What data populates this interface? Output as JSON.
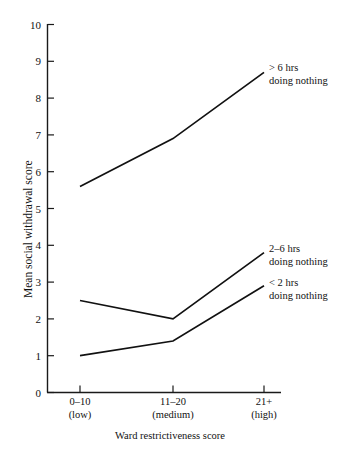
{
  "chart_data": {
    "type": "line",
    "title": "",
    "subtitle": "",
    "xlabel": "Ward restrictiveness score",
    "ylabel": "Mean social withdrawal score",
    "categories": [
      "0–10\n(low)",
      "11–20\n(medium)",
      "21+\n(high)"
    ],
    "category_labels": [
      {
        "line1": "0–10",
        "line2": "(low)"
      },
      {
        "line1": "11–20",
        "line2": "(medium)"
      },
      {
        "line1": "21+",
        "line2": "(high)"
      }
    ],
    "ylim": [
      0,
      10
    ],
    "ytick_labels": [
      "0",
      "1",
      "2",
      "3",
      "4",
      "5",
      "6",
      "7",
      "8",
      "9",
      "10"
    ],
    "ytick_values": [
      0,
      1,
      2,
      3,
      4,
      5,
      6,
      7,
      8,
      9,
      10
    ],
    "grid": false,
    "legend_position": "right-inline-annotations",
    "series": [
      {
        "name": "> 6 hrs doing nothing",
        "label_line1": "> 6 hrs",
        "label_line2": "doing nothing",
        "values": [
          5.6,
          6.9,
          8.7
        ],
        "color": "#111111"
      },
      {
        "name": "2–6 hrs doing nothing",
        "label_line1": "2–6 hrs",
        "label_line2": "doing nothing",
        "values": [
          2.5,
          2.0,
          3.8
        ],
        "color": "#111111"
      },
      {
        "name": "< 2 hrs doing nothing",
        "label_line1": "< 2 hrs",
        "label_line2": "doing nothing",
        "values": [
          1.0,
          1.4,
          2.9
        ],
        "color": "#111111"
      }
    ]
  },
  "axes": {
    "y_title": "Mean social withdrawal score",
    "x_title": "Ward restrictiveness score"
  },
  "yticks": {
    "t0": "0",
    "t1": "1",
    "t2": "2",
    "t3": "3",
    "t4": "4",
    "t5": "5",
    "t6": "6",
    "t7": "7",
    "t8": "8",
    "t9": "9",
    "t10": "10"
  },
  "xcats": {
    "c0_l1": "0–10",
    "c0_l2": "(low)",
    "c1_l1": "11–20",
    "c1_l2": "(medium)",
    "c2_l1": "21+",
    "c2_l2": "(high)"
  },
  "annotations": {
    "a0_l1": "> 6 hrs",
    "a0_l2": "doing nothing",
    "a1_l1": "2–6 hrs",
    "a1_l2": "doing nothing",
    "a2_l1": "< 2 hrs",
    "a2_l2": "doing nothing"
  },
  "colors": {
    "line": "#111111",
    "axis": "#1a1a1a",
    "background": "#ffffff"
  }
}
